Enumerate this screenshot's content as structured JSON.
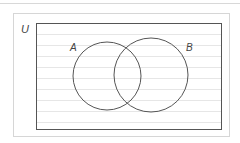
{
  "diagram": {
    "type": "venn",
    "universe_label": "U",
    "sets": [
      {
        "label": "A",
        "cx": 107,
        "cy": 76,
        "r": 34
      },
      {
        "label": "B",
        "cx": 151,
        "cy": 75,
        "r": 37
      }
    ],
    "universe_rect": {
      "x": 36,
      "y": 23,
      "width": 185,
      "height": 106
    },
    "ruled_lines_y": [
      34,
      45,
      56,
      67,
      78,
      89,
      100,
      111,
      122
    ],
    "colors": {
      "outline": "#555555",
      "ruled_line": "#e6e6e6",
      "frame": "#d6d6d6"
    }
  }
}
